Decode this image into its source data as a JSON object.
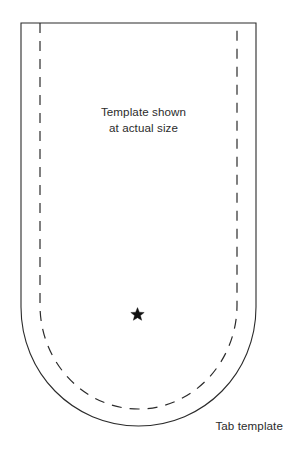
{
  "figure": {
    "name": "tab-template-sewing-pattern",
    "caption": "Tab template",
    "instruction": {
      "line1": "Template shown",
      "line2": "at actual size"
    },
    "marker": {
      "glyph": "star",
      "name": "star-marker",
      "x": 137,
      "y": 313,
      "size": 9
    },
    "colors": {
      "background": "#ffffff",
      "outline": "#2b2b2b",
      "dashed_line": "#2b2b2b",
      "text": "#2b2b2b",
      "marker": "#111111"
    },
    "geometry": {
      "outer": {
        "left": 21,
        "right": 256,
        "top": 23,
        "straight_bottom": 307,
        "curve_bottom": 426,
        "stroke_width": 1.1,
        "style": "solid"
      },
      "inner": {
        "left": 40,
        "right": 237,
        "top": 23,
        "straight_bottom": 307,
        "curve_bottom": 409,
        "stroke_width": 1.2,
        "style": "dashed",
        "dash_on": 10,
        "dash_off": 8
      }
    }
  }
}
